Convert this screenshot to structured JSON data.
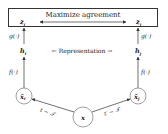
{
  "diagram": {
    "top_box": {
      "label": "Maximize agreement"
    },
    "nodes": {
      "z_i": "z",
      "z_i_sub": "i",
      "z_j": "z",
      "z_j_sub": "j",
      "h_i": "h",
      "h_i_sub": "i",
      "h_j": "h",
      "h_j_sub": "j",
      "x_i": "x̃",
      "x_i_sub": "i",
      "x_j": "x̃",
      "x_j_sub": "j",
      "x": "x"
    },
    "edge_labels": {
      "g_left": "g(·)",
      "g_right": "g(·)",
      "f_left": "f(·)",
      "f_right": "f(·)",
      "representation": "←  Representation  →",
      "t_left": "t ∼ 𝒯",
      "t_right": "t′ ∼ 𝒯"
    }
  }
}
